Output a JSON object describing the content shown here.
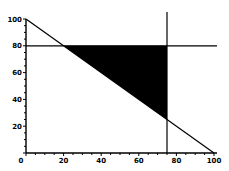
{
  "chart_data": {
    "type": "line",
    "title": "",
    "xlabel": "",
    "ylabel": "",
    "xlim": [
      0,
      100
    ],
    "ylim": [
      0,
      100
    ],
    "grid": false,
    "x_ticks": [
      0,
      20,
      40,
      60,
      80,
      100
    ],
    "y_ticks": [
      20,
      40,
      60,
      80,
      100
    ],
    "x_tick_labels": [
      "0",
      "20",
      "40",
      "60",
      "80",
      "100"
    ],
    "y_tick_labels": [
      "20",
      "40",
      "60",
      "80",
      "100"
    ],
    "series": [
      {
        "name": "x + y = 100",
        "x": [
          0,
          100
        ],
        "y": [
          100,
          0
        ]
      },
      {
        "name": "y = 80",
        "x": [
          0,
          100
        ],
        "y": [
          80,
          80
        ]
      },
      {
        "name": "x = 75",
        "x": [
          75,
          75
        ],
        "y": [
          0,
          108
        ]
      }
    ],
    "shaded_region": {
      "fill": "#000000",
      "vertices": [
        [
          20,
          80
        ],
        [
          75,
          80
        ],
        [
          75,
          25
        ]
      ]
    }
  }
}
